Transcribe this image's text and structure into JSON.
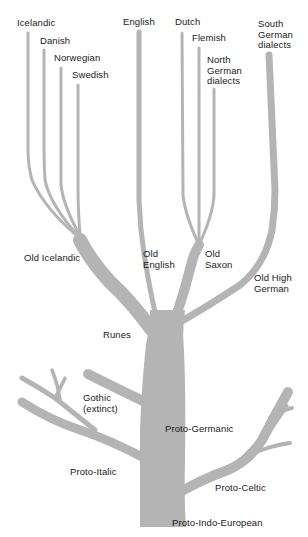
{
  "diagram": {
    "type": "language-family-tree",
    "branch_color": "#b4b4b4",
    "text_color": "#1a1a1a",
    "root": "Proto-Indo-European",
    "labels": {
      "icelandic": "Icelandic",
      "danish": "Danish",
      "norwegian": "Norwegian",
      "swedish": "Swedish",
      "english": "English",
      "dutch": "Dutch",
      "flemish": "Flemish",
      "north_german": "North\nGerman\ndialects",
      "south_german": "South\nGerman\ndialects",
      "old_icelandic": "Old Icelandic",
      "old_english": "Old\nEnglish",
      "old_saxon": "Old\nSaxon",
      "old_high_german": "Old High\nGerman",
      "runes": "Runes",
      "gothic": "Gothic\n(extinct)",
      "proto_germanic": "Proto-Germanic",
      "proto_italic": "Proto-Italic",
      "proto_celtic": "Proto-Celtic",
      "proto_indo_european": "Proto-Indo-European"
    },
    "edges": [
      [
        "Proto-Indo-European",
        "Proto-Germanic"
      ],
      [
        "Proto-Indo-European",
        "Proto-Italic"
      ],
      [
        "Proto-Indo-European",
        "Proto-Celtic"
      ],
      [
        "Proto-Germanic",
        "Gothic (extinct)"
      ],
      [
        "Proto-Germanic",
        "Runes"
      ],
      [
        "Runes",
        "Old Icelandic"
      ],
      [
        "Runes",
        "Old English"
      ],
      [
        "Runes",
        "Old Saxon"
      ],
      [
        "Runes",
        "Old High German"
      ],
      [
        "Old Icelandic",
        "Icelandic"
      ],
      [
        "Old Icelandic",
        "Danish"
      ],
      [
        "Old Icelandic",
        "Norwegian"
      ],
      [
        "Old Icelandic",
        "Swedish"
      ],
      [
        "Old English",
        "English"
      ],
      [
        "Old Saxon",
        "Dutch"
      ],
      [
        "Old Saxon",
        "Flemish"
      ],
      [
        "Old Saxon",
        "North German dialects"
      ],
      [
        "Old High German",
        "South German dialects"
      ]
    ]
  }
}
